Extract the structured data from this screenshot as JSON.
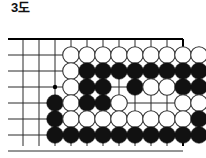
{
  "figure": {
    "title": "3도",
    "type": "go-board-diagram",
    "language": "ko"
  },
  "board": {
    "cols": 11,
    "rows": 8,
    "spacing": 16,
    "origin_x": 23,
    "origin_y": 23,
    "line_color": "#2b2b2b",
    "edge_color": "#000000",
    "background": "#ffffff",
    "star_points": [
      {
        "col": 2,
        "row": 3
      }
    ],
    "edges": {
      "top": true,
      "right": true,
      "left": false,
      "bottom": false
    },
    "stone_colors": {
      "black": "#111111",
      "white": "#ffffff",
      "outline": "#333333"
    },
    "stones": [
      {
        "col": 4,
        "row": 1,
        "color": "white"
      },
      {
        "col": 5,
        "row": 1,
        "color": "white"
      },
      {
        "col": 6,
        "row": 1,
        "color": "white"
      },
      {
        "col": 7,
        "row": 1,
        "color": "white"
      },
      {
        "col": 8,
        "row": 1,
        "color": "white"
      },
      {
        "col": 9,
        "row": 1,
        "color": "white"
      },
      {
        "col": 10,
        "row": 1,
        "color": "white"
      },
      {
        "col": 11,
        "row": 1,
        "color": "white"
      },
      {
        "col": 12,
        "row": 1,
        "color": "white"
      },
      {
        "col": 4,
        "row": 2,
        "color": "white"
      },
      {
        "col": 5,
        "row": 2,
        "color": "black"
      },
      {
        "col": 6,
        "row": 2,
        "color": "black"
      },
      {
        "col": 7,
        "row": 2,
        "color": "black"
      },
      {
        "col": 8,
        "row": 2,
        "color": "black"
      },
      {
        "col": 9,
        "row": 2,
        "color": "black"
      },
      {
        "col": 10,
        "row": 2,
        "color": "black"
      },
      {
        "col": 11,
        "row": 2,
        "color": "black"
      },
      {
        "col": 12,
        "row": 2,
        "color": "black"
      },
      {
        "col": 4,
        "row": 3,
        "color": "white"
      },
      {
        "col": 5,
        "row": 3,
        "color": "black"
      },
      {
        "col": 6,
        "row": 3,
        "color": "black"
      },
      {
        "col": 8,
        "row": 3,
        "color": "black"
      },
      {
        "col": 9,
        "row": 3,
        "color": "white"
      },
      {
        "col": 10,
        "row": 3,
        "color": "white"
      },
      {
        "col": 11,
        "row": 3,
        "color": "black"
      },
      {
        "col": 12,
        "row": 3,
        "color": "black"
      },
      {
        "col": 3,
        "row": 4,
        "color": "black"
      },
      {
        "col": 4,
        "row": 4,
        "color": "white"
      },
      {
        "col": 5,
        "row": 4,
        "color": "black"
      },
      {
        "col": 6,
        "row": 4,
        "color": "black"
      },
      {
        "col": 7,
        "row": 4,
        "color": "white"
      },
      {
        "col": 11,
        "row": 4,
        "color": "white"
      },
      {
        "col": 12,
        "row": 4,
        "color": "white"
      },
      {
        "col": 3,
        "row": 5,
        "color": "black"
      },
      {
        "col": 4,
        "row": 5,
        "color": "white"
      },
      {
        "col": 5,
        "row": 5,
        "color": "white"
      },
      {
        "col": 6,
        "row": 5,
        "color": "white"
      },
      {
        "col": 7,
        "row": 5,
        "color": "white"
      },
      {
        "col": 8,
        "row": 5,
        "color": "white"
      },
      {
        "col": 9,
        "row": 5,
        "color": "white"
      },
      {
        "col": 10,
        "row": 5,
        "color": "white"
      },
      {
        "col": 11,
        "row": 5,
        "color": "white"
      },
      {
        "col": 12,
        "row": 5,
        "color": "black"
      },
      {
        "col": 3,
        "row": 6,
        "color": "black"
      },
      {
        "col": 4,
        "row": 6,
        "color": "black"
      },
      {
        "col": 5,
        "row": 6,
        "color": "black"
      },
      {
        "col": 6,
        "row": 6,
        "color": "black"
      },
      {
        "col": 7,
        "row": 6,
        "color": "black"
      },
      {
        "col": 8,
        "row": 6,
        "color": "black"
      },
      {
        "col": 9,
        "row": 6,
        "color": "black"
      },
      {
        "col": 10,
        "row": 6,
        "color": "black"
      },
      {
        "col": 11,
        "row": 6,
        "color": "black"
      },
      {
        "col": 12,
        "row": 6,
        "color": "black"
      }
    ]
  }
}
